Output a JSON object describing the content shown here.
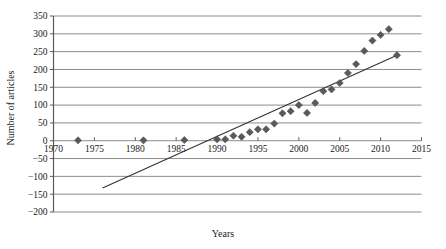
{
  "chart_data": {
    "type": "scatter",
    "title": "",
    "xlabel": "Years",
    "ylabel": "Number of articles",
    "xlim": [
      1970,
      2015
    ],
    "ylim": [
      -200,
      350
    ],
    "xticks": [
      1970,
      1975,
      1980,
      1985,
      1990,
      1995,
      2000,
      2005,
      2010,
      2015
    ],
    "yticks": [
      -200,
      -150,
      -100,
      -50,
      0,
      50,
      100,
      150,
      200,
      250,
      300,
      350
    ],
    "xtick_labels": [
      "1970",
      "1975",
      "1980",
      "1985",
      "1990",
      "1995",
      "2000",
      "2005",
      "2010",
      "2015"
    ],
    "ytick_labels": [
      "-200",
      "-150",
      "-100",
      "-50",
      "0",
      "50",
      "100",
      "150",
      "200",
      "250",
      "300",
      "350"
    ],
    "grid": "horizontal",
    "legend": "none",
    "marker": "diamond",
    "marker_color": "#595959",
    "line_color": "#333333",
    "series": [
      {
        "name": "Number of articles",
        "x": [
          1973,
          1981,
          1986,
          1990,
          1991,
          1992,
          1993,
          1994,
          1995,
          1996,
          1997,
          1998,
          1999,
          2000,
          2001,
          2002,
          2003,
          2004,
          2005,
          2006,
          2007,
          2008,
          2009,
          2010,
          2011,
          2012
        ],
        "values": [
          1,
          1,
          2,
          4,
          4,
          14,
          11,
          24,
          32,
          32,
          48,
          77,
          83,
          100,
          78,
          106,
          139,
          144,
          162,
          190,
          215,
          252,
          281,
          297,
          313,
          240
        ]
      }
    ],
    "trendline": {
      "name": "linear trend",
      "x": [
        1976.0,
        2012.0
      ],
      "y": [
        -133,
        240
      ]
    }
  },
  "axis_titles": {
    "x": "Years",
    "y": "Number of articles"
  }
}
